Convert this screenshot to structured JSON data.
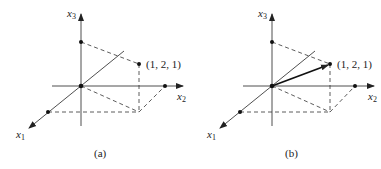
{
  "panels": [
    {
      "id": "a",
      "caption": "(a)",
      "point_label": "(1, 2, 1)",
      "axis_labels": {
        "x1": "x",
        "x1_sub": "1",
        "x2": "x",
        "x2_sub": "2",
        "x3": "x",
        "x3_sub": "3"
      },
      "has_vector": false
    },
    {
      "id": "b",
      "caption": "(b)",
      "point_label": "(1, 2, 1)",
      "axis_labels": {
        "x1": "x",
        "x1_sub": "1",
        "x2": "x",
        "x2_sub": "2",
        "x3": "x",
        "x3_sub": "3"
      },
      "has_vector": true
    }
  ],
  "point": [
    1,
    2,
    1
  ],
  "colors": {
    "stroke": "#222222",
    "background": "#ffffff"
  }
}
